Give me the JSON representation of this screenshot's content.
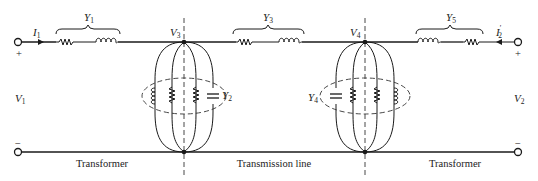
{
  "diagram": {
    "terminals": {
      "left_plus": "+",
      "left_minus": "−",
      "right_plus": "+",
      "right_minus": "−"
    },
    "voltages": {
      "v1": "V",
      "v1_sub": "1",
      "v2": "V",
      "v2_sub": "2",
      "v3": "V",
      "v3_sub": "3",
      "v4": "V",
      "v4_sub": "4"
    },
    "currents": {
      "i1": "I",
      "i1_sub": "1",
      "i2": "I",
      "i2_sub": "2",
      "i2_prime": "′"
    },
    "admittances": {
      "y1": "Y",
      "y1_sub": "1",
      "y2": "Y",
      "y2_sub": "2",
      "y3": "Y",
      "y3_sub": "3",
      "y4": "Y",
      "y4_sub": "4",
      "y5": "Y",
      "y5_sub": "5"
    },
    "sections": [
      {
        "label": "Transformer"
      },
      {
        "label": "Transmission line"
      },
      {
        "label": "Transformer"
      }
    ],
    "colors": {
      "line": "#1a1a1a",
      "background": "#ffffff"
    }
  }
}
